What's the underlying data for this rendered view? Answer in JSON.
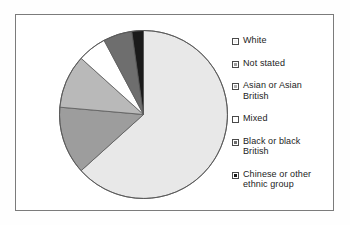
{
  "chart_data": {
    "type": "pie",
    "title": "",
    "categories": [
      "White",
      "Not stated",
      "Asian or Asian British",
      "Mixed",
      "Black or black British",
      "Chinese or other ethnic group"
    ],
    "values": [
      63,
      13,
      10,
      5.5,
      5.5,
      3
    ],
    "unit": "percent",
    "start_angle_deg": 0,
    "direction": "clockwise",
    "legend_position": "right",
    "grid": false,
    "slices": [
      {
        "label": "White",
        "value": 63,
        "start_deg": 0,
        "end_deg": 228,
        "color": "#e8e8e8"
      },
      {
        "label": "Not stated",
        "value": 13,
        "start_deg": 228,
        "end_deg": 275,
        "color": "#9d9d9d"
      },
      {
        "label": "Asian or Asian British",
        "value": 10,
        "start_deg": 275,
        "end_deg": 312,
        "color": "#b9b9b9"
      },
      {
        "label": "Mixed",
        "value": 5.5,
        "start_deg": 312,
        "end_deg": 332,
        "color": "#ffffff"
      },
      {
        "label": "Black or black British",
        "value": 5.5,
        "start_deg": 332,
        "end_deg": 352,
        "color": "#6e6e6e"
      },
      {
        "label": "Chinese or other ethnic group",
        "value": 3,
        "start_deg": 352,
        "end_deg": 360,
        "color": "#1a1a1a"
      }
    ]
  },
  "legend": {
    "items": [
      {
        "label": "White",
        "swatch_color": "#efefef",
        "icon": "legend-swatch-icon"
      },
      {
        "label": "Not stated",
        "swatch_color": "#9d9d9d",
        "icon": "legend-swatch-icon"
      },
      {
        "label": "Asian or Asian\nBritish",
        "swatch_color": "#b0b0b0",
        "icon": "legend-swatch-icon"
      },
      {
        "label": "Mixed",
        "swatch_color": "#ffffff",
        "icon": "legend-swatch-icon"
      },
      {
        "label": "Black or black\nBritish",
        "swatch_color": "#6e6e6e",
        "icon": "legend-swatch-icon"
      },
      {
        "label": "Chinese or other\nethnic group",
        "swatch_color": "#1a1a1a",
        "icon": "legend-swatch-icon"
      }
    ]
  },
  "style": {
    "frame_border": "#7b7b7b",
    "slice_outline": "#5a5a5a",
    "background": "#ffffff"
  }
}
